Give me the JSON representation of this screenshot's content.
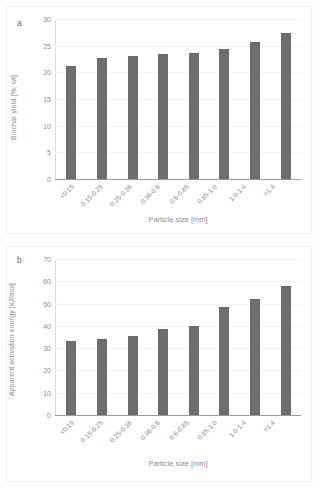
{
  "figure": {
    "background": "#ffffff",
    "bar_color": "#6e6e6e",
    "text_color": "#8d8d8d",
    "grid_color": "#f3f3f3"
  },
  "panels": {
    "a": {
      "letter": "a",
      "xlabel": "Particle size [mm]",
      "ylabel": "Biochar yield [%, wt]",
      "yticks": [
        "30",
        "25",
        "20",
        "15",
        "10",
        "5",
        "0"
      ],
      "xticks": [
        "<0.15",
        "0.15-0.25",
        "0.25-0.36",
        "0.36-0.6",
        "0.6-0.85",
        "0.85-1.0",
        "1.0-1.4",
        ">1.4"
      ]
    },
    "b": {
      "letter": "b",
      "xlabel": "Particle size [mm]",
      "ylabel": "Apparent activation energy [kJ/mol]",
      "yticks": [
        "70",
        "60",
        "50",
        "40",
        "30",
        "20",
        "10",
        "0"
      ],
      "xticks": [
        "<0.15",
        "0.15-0.25",
        "0.25-0.36",
        "0.36-0.6",
        "0.6-0.85",
        "0.85-1.0",
        "1.0-1.4",
        ">1.4"
      ]
    }
  },
  "chart_data": [
    {
      "type": "bar",
      "panel": "a",
      "title": "",
      "xlabel": "Particle size [mm]",
      "ylabel": "Biochar yield [%, wt]",
      "categories": [
        "<0.15",
        "0.15-0.25",
        "0.25-0.36",
        "0.36-0.6",
        "0.6-0.85",
        "0.85-1.0",
        "1.0-1.4",
        ">1.4"
      ],
      "values": [
        21.1,
        22.7,
        23.1,
        23.4,
        23.7,
        24.4,
        25.6,
        27.4
      ],
      "ylim": [
        0,
        30
      ],
      "ytick_step": 5,
      "grid": true,
      "legend": "none",
      "bar_color": "#6e6e6e"
    },
    {
      "type": "bar",
      "panel": "b",
      "title": "",
      "xlabel": "Particle size [mm]",
      "ylabel": "Apparent activation energy [kJ/mol]",
      "categories": [
        "<0.15",
        "0.15-0.25",
        "0.25-0.36",
        "0.36-0.6",
        "0.6-0.85",
        "0.85-1.0",
        "1.0-1.4",
        ">1.4"
      ],
      "values": [
        33.2,
        34.0,
        35.5,
        38.5,
        40.0,
        48.5,
        51.9,
        57.7
      ],
      "ylim": [
        0,
        70
      ],
      "ytick_step": 10,
      "grid": true,
      "legend": "none",
      "bar_color": "#6e6e6e"
    }
  ]
}
